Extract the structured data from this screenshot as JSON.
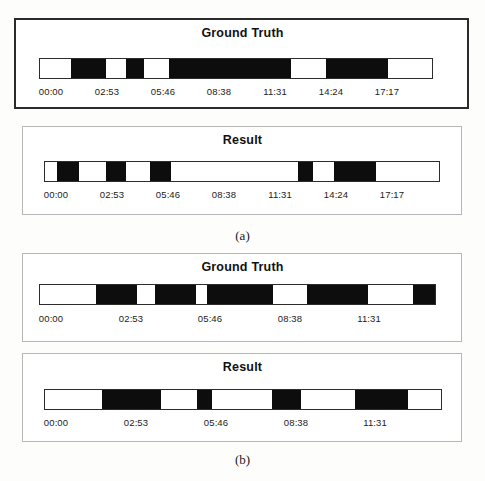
{
  "figure": {
    "background_color": "#fdfdfc",
    "bar_fill_color": "#0d0d0d",
    "bar_border_color": "#2c2c2c",
    "subfigures": [
      {
        "caption": "(a)",
        "caption_top": 228,
        "panels": [
          {
            "name": "ground-truth",
            "title": "Ground Truth",
            "border_style": "thick",
            "box": {
              "left": 14,
              "top": 18,
              "width": 455,
              "height": 91
            },
            "title_top": 26,
            "bar": {
              "left": 39,
              "top": 58,
              "width": 394,
              "height": 21
            },
            "segments": [
              {
                "start": 71.5,
                "end": 106.0
              },
              {
                "start": 126.5,
                "end": 144.5
              },
              {
                "start": 169.0,
                "end": 291.5
              },
              {
                "start": 326.5,
                "end": 388.0
              }
            ],
            "axis_top": 86,
            "ticks": [
              {
                "label": "00:00",
                "x": 51
              },
              {
                "label": "02:53",
                "x": 107
              },
              {
                "label": "05:46",
                "x": 163
              },
              {
                "label": "08:38",
                "x": 219
              },
              {
                "label": "11:31",
                "x": 275
              },
              {
                "label": "14:24",
                "x": 331
              },
              {
                "label": "17:17",
                "x": 387
              }
            ]
          },
          {
            "name": "result",
            "title": "Result",
            "border_style": "thin",
            "box": {
              "left": 22,
              "top": 126,
              "width": 440,
              "height": 89
            },
            "title_top": 133,
            "bar": {
              "left": 44,
              "top": 161,
              "width": 396,
              "height": 21
            },
            "segments": [
              {
                "start": 57.0,
                "end": 79.5
              },
              {
                "start": 106.5,
                "end": 126.5
              },
              {
                "start": 150.0,
                "end": 171.5
              },
              {
                "start": 298.0,
                "end": 313.5
              },
              {
                "start": 334.0,
                "end": 376.5
              }
            ],
            "axis_top": 189,
            "ticks": [
              {
                "label": "00:00",
                "x": 56
              },
              {
                "label": "02:53",
                "x": 112
              },
              {
                "label": "05:46",
                "x": 168
              },
              {
                "label": "08:38",
                "x": 224
              },
              {
                "label": "11:31",
                "x": 280
              },
              {
                "label": "14:24",
                "x": 336
              },
              {
                "label": "17:17",
                "x": 392
              }
            ]
          }
        ]
      },
      {
        "caption": "(b)",
        "caption_top": 452,
        "panels": [
          {
            "name": "ground-truth",
            "title": "Ground Truth",
            "border_style": "thin",
            "box": {
              "left": 22,
              "top": 253,
              "width": 440,
              "height": 89
            },
            "title_top": 260,
            "bar": {
              "left": 39,
              "top": 284,
              "width": 397,
              "height": 21
            },
            "segments": [
              {
                "start": 96.0,
                "end": 137.5
              },
              {
                "start": 155.0,
                "end": 196.0
              },
              {
                "start": 207.5,
                "end": 273.5
              },
              {
                "start": 307.5,
                "end": 368.5
              },
              {
                "start": 413.5,
                "end": 436.0
              }
            ],
            "axis_top": 313,
            "ticks": [
              {
                "label": "00:00",
                "x": 51
              },
              {
                "label": "02:53",
                "x": 131
              },
              {
                "label": "05:46",
                "x": 210
              },
              {
                "label": "08:38",
                "x": 290
              },
              {
                "label": "11:31",
                "x": 369
              }
            ]
          },
          {
            "name": "result",
            "title": "Result",
            "border_style": "thin",
            "box": {
              "left": 22,
              "top": 353,
              "width": 440,
              "height": 89
            },
            "title_top": 360,
            "bar": {
              "left": 44,
              "top": 389,
              "width": 398,
              "height": 21
            },
            "segments": [
              {
                "start": 102.5,
                "end": 161.5
              },
              {
                "start": 197.5,
                "end": 212.5
              },
              {
                "start": 272.5,
                "end": 301.0
              },
              {
                "start": 355.0,
                "end": 408.5
              }
            ],
            "axis_top": 417,
            "ticks": [
              {
                "label": "00:00",
                "x": 56
              },
              {
                "label": "02:53",
                "x": 136
              },
              {
                "label": "05:46",
                "x": 216
              },
              {
                "label": "08:38",
                "x": 296
              },
              {
                "label": "11:31",
                "x": 375
              }
            ]
          }
        ]
      }
    ]
  },
  "chart_data": {
    "type": "table",
    "xlabel": "Time (hh:mm)",
    "ylabel": "",
    "grid": false,
    "legend": "none",
    "subfigures": [
      {
        "caption": "(a)",
        "axis_tick_labels": [
          "00:00",
          "02:53",
          "05:46",
          "08:38",
          "11:31",
          "14:24",
          "17:17"
        ],
        "series": [
          {
            "name": "Ground Truth",
            "bar_pixel_range": [
              39,
              433
            ],
            "black_intervals_px": [
              [
                71.5,
                106.0
              ],
              [
                126.5,
                144.5
              ],
              [
                169.0,
                291.5
              ],
              [
                326.5,
                388.0
              ]
            ]
          },
          {
            "name": "Result",
            "bar_pixel_range": [
              44,
              440
            ],
            "black_intervals_px": [
              [
                57.0,
                79.5
              ],
              [
                106.5,
                126.5
              ],
              [
                150.0,
                171.5
              ],
              [
                298.0,
                313.5
              ],
              [
                334.0,
                376.5
              ]
            ]
          }
        ]
      },
      {
        "caption": "(b)",
        "axis_tick_labels": [
          "00:00",
          "02:53",
          "05:46",
          "08:38",
          "11:31"
        ],
        "series": [
          {
            "name": "Ground Truth",
            "bar_pixel_range": [
              39,
              436
            ],
            "black_intervals_px": [
              [
                96.0,
                137.5
              ],
              [
                155.0,
                196.0
              ],
              [
                207.5,
                273.5
              ],
              [
                307.5,
                368.5
              ],
              [
                413.5,
                436.0
              ]
            ]
          },
          {
            "name": "Result",
            "bar_pixel_range": [
              44,
              442
            ],
            "black_intervals_px": [
              [
                102.5,
                161.5
              ],
              [
                197.5,
                212.5
              ],
              [
                272.5,
                301.0
              ],
              [
                355.0,
                408.5
              ]
            ]
          }
        ]
      }
    ]
  }
}
